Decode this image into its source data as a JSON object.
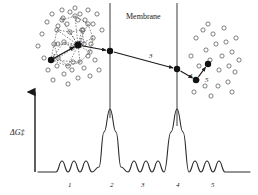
{
  "figure": {
    "membrane_label": "Membrane",
    "y_axis_label": "ΔG‡",
    "background_color": "#ffffff",
    "line_color": "#1a1a1a",
    "solvent_circle_color": "#4a4a4a"
  },
  "steps": [
    {
      "id": "1",
      "label": "1",
      "x": 52,
      "y": 52,
      "description": "ion in bulk water with hydration shell"
    },
    {
      "id": "2",
      "label": "2",
      "x": 79,
      "y": 36,
      "description": "ion at membrane entrance, partial dehydration"
    },
    {
      "id": "3",
      "label": "3",
      "x": 149,
      "y": 52,
      "description": "translocation through membrane interior"
    },
    {
      "id": "4",
      "label": "4",
      "x": 189,
      "y": 72,
      "description": "ion exiting membrane on trans side"
    },
    {
      "id": "5",
      "label": "5",
      "x": 205,
      "y": 76,
      "description": "ion rehydrated in bulk water"
    }
  ],
  "baseline_labels": [
    {
      "label": "1",
      "x": 68,
      "y": 181
    },
    {
      "label": "2",
      "x": 110,
      "y": 181
    },
    {
      "label": "3",
      "x": 141,
      "y": 181
    },
    {
      "label": "4",
      "x": 176,
      "y": 181
    },
    {
      "label": "5",
      "x": 211,
      "y": 181
    }
  ],
  "chart_data": {
    "type": "line",
    "xlabel": "",
    "ylabel": "ΔG‡",
    "grid": false,
    "legend": false,
    "annotations": [
      "Membrane",
      "1",
      "2",
      "3",
      "4",
      "5"
    ],
    "axis": {
      "x_range": [
        35,
        250
      ],
      "y_baseline": 172,
      "y_top": 85
    },
    "features": [
      {
        "kind": "flat",
        "label": "bulk water left",
        "x_start": 38,
        "x_end": 56,
        "height": 0
      },
      {
        "kind": "well-series",
        "label": "1",
        "x_start": 56,
        "x_end": 95,
        "wells": 3,
        "amplitude": 11
      },
      {
        "kind": "barrier",
        "label": "2",
        "x_center": 110,
        "amplitude": 63,
        "width": 22
      },
      {
        "kind": "well-series",
        "label": "3",
        "x_start": 122,
        "x_end": 164,
        "wells": 3,
        "amplitude": 11
      },
      {
        "kind": "barrier",
        "label": "4",
        "x_center": 177,
        "amplitude": 63,
        "width": 22
      },
      {
        "kind": "well-series",
        "label": "5",
        "x_start": 189,
        "x_end": 230,
        "wells": 3,
        "amplitude": 11
      },
      {
        "kind": "flat",
        "label": "bulk water right",
        "x_start": 230,
        "x_end": 250,
        "height": 0
      }
    ],
    "series": [
      {
        "name": "free energy",
        "x": [
          38,
          47,
          56,
          62,
          68,
          74,
          80,
          86,
          92,
          99,
          104,
          110,
          116,
          121,
          128,
          134,
          140,
          146,
          152,
          158,
          164,
          171,
          177,
          183,
          189,
          195,
          201,
          207,
          213,
          219,
          225,
          232,
          240,
          250
        ],
        "y": [
          0,
          0,
          0,
          11,
          0,
          11,
          0,
          11,
          0,
          5,
          40,
          63,
          40,
          5,
          0,
          11,
          0,
          11,
          0,
          11,
          0,
          40,
          63,
          40,
          0,
          11,
          0,
          11,
          0,
          11,
          0,
          0,
          0,
          0
        ]
      }
    ]
  },
  "membrane": {
    "left_boundary_x": 110,
    "right_boundary_x": 177,
    "top_y": 3,
    "label_x": 143,
    "label_y": 18
  },
  "solvent_left": [
    [
      38,
      46
    ],
    [
      42,
      34
    ],
    [
      44,
      58
    ],
    [
      47,
      22
    ],
    [
      48,
      70
    ],
    [
      52,
      14
    ],
    [
      53,
      80
    ],
    [
      57,
      66
    ],
    [
      58,
      26
    ],
    [
      62,
      10
    ],
    [
      63,
      18
    ],
    [
      64,
      74
    ],
    [
      68,
      84
    ],
    [
      70,
      12
    ],
    [
      72,
      70
    ],
    [
      75,
      8
    ],
    [
      78,
      78
    ],
    [
      80,
      14
    ],
    [
      84,
      68
    ],
    [
      85,
      20
    ],
    [
      88,
      10
    ],
    [
      90,
      76
    ],
    [
      93,
      24
    ],
    [
      95,
      60
    ],
    [
      97,
      14
    ],
    [
      99,
      70
    ],
    [
      102,
      30
    ],
    [
      58,
      44
    ],
    [
      67,
      24
    ],
    [
      73,
      62
    ],
    [
      83,
      30
    ],
    [
      91,
      44
    ],
    [
      78,
      20
    ],
    [
      88,
      56
    ]
  ],
  "solvent_right": [
    [
      191,
      56
    ],
    [
      196,
      38
    ],
    [
      199,
      66
    ],
    [
      203,
      30
    ],
    [
      206,
      50
    ],
    [
      210,
      60
    ],
    [
      213,
      34
    ],
    [
      216,
      44
    ],
    [
      219,
      70
    ],
    [
      197,
      80
    ],
    [
      205,
      86
    ],
    [
      211,
      96
    ],
    [
      222,
      56
    ],
    [
      226,
      42
    ],
    [
      229,
      66
    ],
    [
      232,
      52
    ],
    [
      236,
      38
    ],
    [
      239,
      60
    ],
    [
      218,
      86
    ],
    [
      228,
      82
    ],
    [
      235,
      72
    ],
    [
      194,
      92
    ],
    [
      208,
      24
    ],
    [
      224,
      28
    ],
    [
      232,
      92
    ]
  ],
  "hydration_shell_left": {
    "ion_a": {
      "x": 51,
      "y": 60,
      "r": 3.2
    },
    "ion_b": {
      "x": 78,
      "y": 45,
      "r": 3.6
    },
    "waters": [
      [
        62,
        20
      ],
      [
        75,
        16
      ],
      [
        88,
        24
      ],
      [
        93,
        38
      ],
      [
        90,
        52
      ],
      [
        80,
        62
      ],
      [
        68,
        66
      ],
      [
        58,
        58
      ],
      [
        54,
        44
      ],
      [
        57,
        30
      ],
      [
        70,
        32
      ],
      [
        82,
        30
      ],
      [
        84,
        44
      ],
      [
        72,
        48
      ],
      [
        64,
        42
      ]
    ]
  },
  "transport_path": [
    {
      "x": 78,
      "y": 45
    },
    {
      "x": 110,
      "y": 51
    },
    {
      "x": 177,
      "y": 69
    },
    {
      "x": 196,
      "y": 80
    },
    {
      "x": 208,
      "y": 64
    }
  ]
}
